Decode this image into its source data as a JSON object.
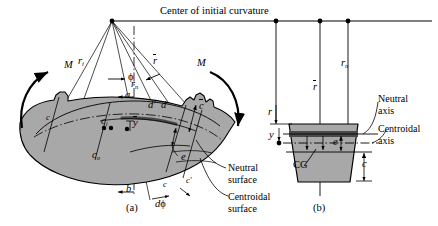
{
  "figure": {
    "title": "Center of initial curvature",
    "panels": [
      {
        "id": "a",
        "caption": "(a)",
        "description": "curved beam segment in pure bending"
      },
      {
        "id": "b",
        "caption": "(b)",
        "description": "trapezoidal cross section"
      }
    ]
  },
  "panel_a": {
    "moment_left": "M",
    "moment_right": "M",
    "radius_inner": "r",
    "radius_inner_sub": "i",
    "radius_mean": "r",
    "radius_neutral": "r",
    "radius_neutral_sub": "n",
    "angle": "ϕ",
    "delta_angle_d": "d",
    "delta_angle_phi": "ϕ",
    "point_a": "a",
    "point_b": "b",
    "point_c": "c",
    "point_c_prime": "c′",
    "point_d": "d",
    "point_d_prime": "d′",
    "dist_ci": "c",
    "dist_ci_sub": "i",
    "dist_co": "c",
    "dist_co_sub": "o",
    "dist_cbar": "c",
    "dist_ybar": "y",
    "dist_e": "e",
    "label_neutral_surface_line1": "Neutral",
    "label_neutral_surface_line2": "surface",
    "label_centroidal_surface_line1": "Centroidal",
    "label_centroidal_surface_line2": "surface",
    "caption": "(a)"
  },
  "panel_b": {
    "radius_mean": "r",
    "radius_neutral": "r",
    "radius_neutral_sub": "n",
    "dist_r": "r",
    "dist_y": "y",
    "dist_e": "e",
    "dist_cbar": "c",
    "centroid_label": "CG",
    "label_neutral_axis_line1": "Neutral",
    "label_neutral_axis_line2": "axis",
    "label_centroidal_axis_line1": "Centroidal",
    "label_centroidal_axis_line2": "axis",
    "caption": "(b)"
  },
  "colors": {
    "beam_fill": "#a8a8a8",
    "section_fill": "#a8a8a8",
    "neutral_band": "#4a4a4a",
    "stroke": "#000000",
    "background": "#ffffff"
  }
}
